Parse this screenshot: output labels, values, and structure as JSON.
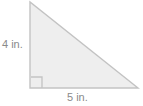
{
  "figure": {
    "kind": "right-triangle-diagram",
    "background_color": "#ffffff",
    "fill_color": "#eeeeee",
    "stroke_color": "#c3c3c3",
    "text_color": "#8a8a8a",
    "vertices": {
      "apex": {
        "x": 30,
        "y": 2
      },
      "right_angle": {
        "x": 30,
        "y": 88
      },
      "base_right": {
        "x": 138,
        "y": 88
      }
    },
    "right_angle_marker": {
      "x": 31,
      "y": 77,
      "size": 11
    },
    "labels": {
      "vertical_leg": "4 in.",
      "horizontal_leg": "5 in."
    }
  },
  "chart_data": {
    "type": "diagram",
    "title": "",
    "shape": "right triangle",
    "measurements": [
      {
        "side": "vertical leg (height)",
        "value": 4,
        "unit": "in.",
        "label": "4 in."
      },
      {
        "side": "horizontal leg (base)",
        "value": 5,
        "unit": "in.",
        "label": "5 in."
      }
    ],
    "annotations": [
      "right angle at bottom-left vertex"
    ]
  }
}
